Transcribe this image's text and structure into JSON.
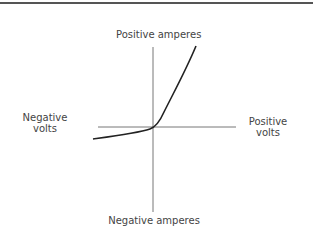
{
  "diagram": {
    "title": "",
    "labels": {
      "positive_amperes": "Positive amperes",
      "negative_amperes": "Negative amperes",
      "negative_volts_line1": "Negative",
      "negative_volts_line2": "volts",
      "positive_volts_line1": "Positive",
      "positive_volts_line2": "volts"
    },
    "colors": {
      "axis": "#666666",
      "curve": "#222222",
      "text": "#444444"
    }
  }
}
